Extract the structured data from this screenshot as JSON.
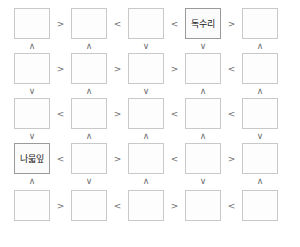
{
  "board": {
    "columns": 5,
    "rows": 5,
    "cell_border_color": "#c9c9c9",
    "filled_cell_border_color": "#9a9a9a",
    "operator_color": "#6e6e6e",
    "background_color": "#ffffff",
    "greater_than": ">",
    "less_than": "<",
    "up_caret": "∧",
    "down_caret": "∨"
  },
  "cells": [
    [
      {
        "text": "",
        "filled": false
      },
      {
        "text": "",
        "filled": false
      },
      {
        "text": "",
        "filled": false
      },
      {
        "text": "독수리",
        "filled": true
      },
      {
        "text": "",
        "filled": false
      }
    ],
    [
      {
        "text": "",
        "filled": false
      },
      {
        "text": "",
        "filled": false
      },
      {
        "text": "",
        "filled": false
      },
      {
        "text": "",
        "filled": false
      },
      {
        "text": "",
        "filled": false
      }
    ],
    [
      {
        "text": "",
        "filled": false
      },
      {
        "text": "",
        "filled": false
      },
      {
        "text": "",
        "filled": false
      },
      {
        "text": "",
        "filled": false
      },
      {
        "text": "",
        "filled": false
      }
    ],
    [
      {
        "text": "나묿잎",
        "filled": true
      },
      {
        "text": "",
        "filled": false
      },
      {
        "text": "",
        "filled": false
      },
      {
        "text": "",
        "filled": false
      },
      {
        "text": "",
        "filled": false
      }
    ],
    [
      {
        "text": "",
        "filled": false
      },
      {
        "text": "",
        "filled": false
      },
      {
        "text": "",
        "filled": false
      },
      {
        "text": "",
        "filled": false
      },
      {
        "text": "",
        "filled": false
      }
    ]
  ],
  "horizontal_operators": [
    [
      ">",
      "<",
      "<",
      ">"
    ],
    [
      ">",
      ">",
      ">",
      "<"
    ],
    [
      "<",
      ">",
      "<",
      "<"
    ],
    [
      "<",
      ">",
      "<",
      ">"
    ],
    [
      ">",
      "<",
      ">",
      "<"
    ]
  ],
  "vertical_operators": [
    [
      "∧",
      "∧",
      "∨",
      "∨",
      "∧"
    ],
    [
      "∨",
      "∧",
      "∨",
      "∧",
      "∧"
    ],
    [
      "∨",
      "∧",
      "∧",
      "∧",
      "∨"
    ],
    [
      "∧",
      "∨",
      "∧",
      "∨",
      "∧"
    ]
  ]
}
